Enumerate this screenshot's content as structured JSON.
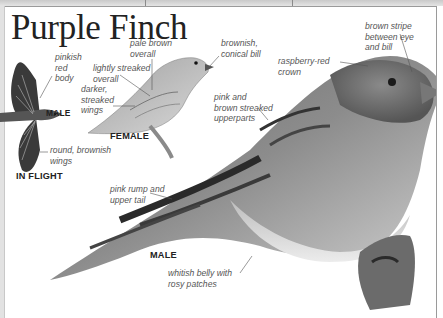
{
  "page": {
    "title": "Purple Finch",
    "color_mode": "grayscale"
  },
  "labels": {
    "pinkish_red_body": "pinkish\nred\nbody",
    "male_flight": "MALE",
    "round_brownish_wings": "round, brownish\nwings",
    "in_flight": "IN FLIGHT",
    "pale_brown_overall": "pale brown\noverall",
    "lightly_streaked_overall": "lightly streaked\noverall",
    "darker_streaked_wings": "darker,\nstreaked\nwings",
    "female": "FEMALE",
    "brownish_conical_bill": "brownish,\nconical bill",
    "raspberry_red_crown": "raspberry-red\ncrown",
    "brown_stripe": "brown stripe\nbetween eye\nand bill",
    "pink_brown_upperparts": "pink and\nbrown streaked\nupperparts",
    "pink_rump": "pink rump and\nupper tail",
    "male": "MALE",
    "whitish_belly": "whitish belly with\nrosy patches"
  },
  "colors": {
    "title": "#222222",
    "label": "#555555",
    "tag": "#222222",
    "leader_line": "#555555"
  }
}
